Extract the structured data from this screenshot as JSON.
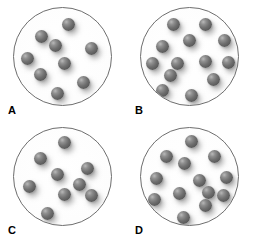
{
  "figure": {
    "type": "particle-concentration-diagram",
    "panel_count": 4,
    "vessel_shape": "circle",
    "particle_shape": "sphere",
    "particle_color": "#6f6f6f",
    "vessel_outline_color": "#6e6e6e",
    "background_color": "#ffffff"
  },
  "panels": [
    {
      "id": "A",
      "label": "A",
      "particle_count": 9,
      "particles": [
        {
          "x": 56,
          "y": 17
        },
        {
          "x": 28,
          "y": 29
        },
        {
          "x": 43,
          "y": 39
        },
        {
          "x": 80,
          "y": 42
        },
        {
          "x": 14,
          "y": 52
        },
        {
          "x": 52,
          "y": 57
        },
        {
          "x": 27,
          "y": 69
        },
        {
          "x": 72,
          "y": 77
        },
        {
          "x": 45,
          "y": 88
        }
      ]
    },
    {
      "id": "B",
      "label": "B",
      "particle_count": 13,
      "particles": [
        {
          "x": 34,
          "y": 17
        },
        {
          "x": 67,
          "y": 17
        },
        {
          "x": 50,
          "y": 34
        },
        {
          "x": 86,
          "y": 34
        },
        {
          "x": 22,
          "y": 40
        },
        {
          "x": 12,
          "y": 57
        },
        {
          "x": 38,
          "y": 57
        },
        {
          "x": 66,
          "y": 55
        },
        {
          "x": 90,
          "y": 56
        },
        {
          "x": 30,
          "y": 70
        },
        {
          "x": 75,
          "y": 74
        },
        {
          "x": 22,
          "y": 85
        },
        {
          "x": 52,
          "y": 90
        }
      ]
    },
    {
      "id": "C",
      "label": "C",
      "particle_count": 9,
      "particles": [
        {
          "x": 52,
          "y": 15
        },
        {
          "x": 27,
          "y": 31
        },
        {
          "x": 45,
          "y": 48
        },
        {
          "x": 76,
          "y": 42
        },
        {
          "x": 16,
          "y": 60
        },
        {
          "x": 52,
          "y": 69
        },
        {
          "x": 80,
          "y": 70
        },
        {
          "x": 35,
          "y": 88
        },
        {
          "x": 68,
          "y": 58
        }
      ]
    },
    {
      "id": "D",
      "label": "D",
      "particle_count": 13,
      "particles": [
        {
          "x": 52,
          "y": 14
        },
        {
          "x": 26,
          "y": 29
        },
        {
          "x": 76,
          "y": 29
        },
        {
          "x": 45,
          "y": 37
        },
        {
          "x": 16,
          "y": 52
        },
        {
          "x": 60,
          "y": 54
        },
        {
          "x": 88,
          "y": 51
        },
        {
          "x": 40,
          "y": 68
        },
        {
          "x": 14,
          "y": 74
        },
        {
          "x": 85,
          "y": 70
        },
        {
          "x": 66,
          "y": 80
        },
        {
          "x": 44,
          "y": 92
        },
        {
          "x": 70,
          "y": 66
        }
      ]
    }
  ]
}
